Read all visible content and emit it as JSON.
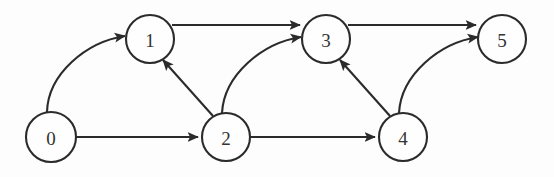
{
  "figure": {
    "name": "directed-acyclic-graph",
    "width": 554,
    "height": 177,
    "background_color": "#fdfdfd",
    "stroke_color": "#2b2b2b",
    "node_fill_color": "#fefefe",
    "label_color": "#333333"
  },
  "graph": {
    "type": "directed-graph",
    "directed": true,
    "node_count": 6,
    "edge_count": 9,
    "nodes": [
      {
        "id": "0",
        "label": "0",
        "cx": 51,
        "cy": 137,
        "r": 25
      },
      {
        "id": "1",
        "label": "1",
        "cx": 150,
        "cy": 39,
        "r": 24
      },
      {
        "id": "2",
        "label": "2",
        "cx": 226,
        "cy": 137,
        "r": 24
      },
      {
        "id": "3",
        "label": "3",
        "cx": 326,
        "cy": 39,
        "r": 24
      },
      {
        "id": "4",
        "label": "4",
        "cx": 403,
        "cy": 137,
        "r": 24
      },
      {
        "id": "5",
        "label": "5",
        "cx": 502,
        "cy": 39,
        "r": 24
      }
    ],
    "edges": [
      {
        "id": "e01",
        "from": "0",
        "to": "1",
        "shape": "curve",
        "d": "M 47 112 C 48 74 86 42 125 36"
      },
      {
        "id": "e02",
        "from": "0",
        "to": "2",
        "shape": "straight",
        "d": "M 76 137 L 198 137"
      },
      {
        "id": "e13",
        "from": "1",
        "to": "3",
        "shape": "straight",
        "d": "M 172 25 L 300 25"
      },
      {
        "id": "e21",
        "from": "2",
        "to": "1",
        "shape": "straight",
        "d": "M 213 116 L 163 60"
      },
      {
        "id": "e23",
        "from": "2",
        "to": "3",
        "shape": "curve",
        "d": "M 222 113 C 224 75 262 43 301 37"
      },
      {
        "id": "e24",
        "from": "2",
        "to": "4",
        "shape": "straight",
        "d": "M 250 137 L 375 137"
      },
      {
        "id": "e35",
        "from": "3",
        "to": "5",
        "shape": "straight",
        "d": "M 348 25 L 476 25"
      },
      {
        "id": "e43",
        "from": "4",
        "to": "3",
        "shape": "straight",
        "d": "M 390 116 L 340 60"
      },
      {
        "id": "e45",
        "from": "4",
        "to": "5",
        "shape": "curve",
        "d": "M 399 113 C 401 75 439 43 478 37"
      }
    ]
  }
}
